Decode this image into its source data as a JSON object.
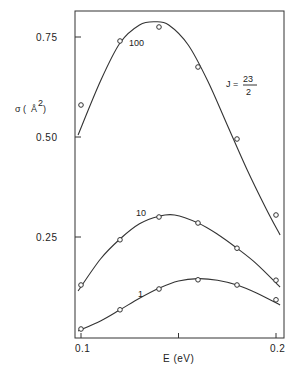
{
  "chart_data": {
    "type": "line",
    "title": "",
    "xlabel": "E (eV)",
    "ylabel": "σ (Å²)",
    "xlim": [
      0.0985,
      0.2021
    ],
    "ylim": [
      0.0,
      0.818
    ],
    "x_ticks": [
      {
        "value": 0.1,
        "label": "0.1"
      },
      {
        "value": 0.15,
        "label": ""
      },
      {
        "value": 0.2,
        "label": "0.2"
      }
    ],
    "y_ticks": [
      {
        "value": 0.25,
        "label": "0.25"
      },
      {
        "value": 0.5,
        "label": "0.50"
      },
      {
        "value": 0.75,
        "label": "0.75"
      }
    ],
    "grid": false,
    "annotation": {
      "text": "J =",
      "numerator": "23",
      "denominator": "2"
    },
    "series": [
      {
        "name": "100",
        "points_x": [
          0.1,
          0.12,
          0.14,
          0.16,
          0.18,
          0.2
        ],
        "points_y": [
          0.58,
          0.74,
          0.775,
          0.675,
          0.495,
          0.305
        ],
        "curve_x": [
          0.0985,
          0.11,
          0.12,
          0.13,
          0.138,
          0.145,
          0.155,
          0.165,
          0.175,
          0.185,
          0.195,
          0.2021
        ],
        "curve_y": [
          0.505,
          0.64,
          0.735,
          0.78,
          0.788,
          0.78,
          0.73,
          0.64,
          0.53,
          0.42,
          0.32,
          0.255
        ]
      },
      {
        "name": "10",
        "points_x": [
          0.1,
          0.12,
          0.14,
          0.16,
          0.18,
          0.2
        ],
        "points_y": [
          0.13,
          0.243,
          0.3,
          0.285,
          0.222,
          0.142
        ],
        "curve_x": [
          0.0985,
          0.11,
          0.12,
          0.13,
          0.14,
          0.148,
          0.16,
          0.17,
          0.18,
          0.19,
          0.2021
        ],
        "curve_y": [
          0.115,
          0.195,
          0.245,
          0.283,
          0.302,
          0.305,
          0.285,
          0.257,
          0.222,
          0.183,
          0.125
        ]
      },
      {
        "name": "1",
        "points_x": [
          0.1,
          0.12,
          0.14,
          0.16,
          0.18,
          0.2
        ],
        "points_y": [
          0.02,
          0.068,
          0.12,
          0.143,
          0.13,
          0.093
        ],
        "curve_x": [
          0.0985,
          0.11,
          0.12,
          0.13,
          0.14,
          0.15,
          0.16,
          0.17,
          0.18,
          0.19,
          0.2021
        ],
        "curve_y": [
          0.015,
          0.04,
          0.068,
          0.097,
          0.122,
          0.14,
          0.146,
          0.142,
          0.13,
          0.11,
          0.08
        ]
      }
    ],
    "legend": "none (curves labeled inline: 100, 10, 1)"
  }
}
